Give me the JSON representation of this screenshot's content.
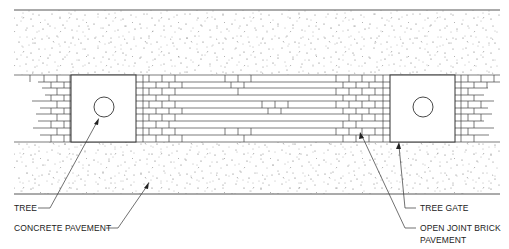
{
  "diagram": {
    "type": "plan-view detail",
    "colors": {
      "line": "#333333",
      "stipple": "#555555",
      "background": "#ffffff"
    }
  },
  "labels": {
    "tree": "TREE",
    "concrete_pavement": "CONCRETE PAVEMENT",
    "tree_gate": "TREE GATE",
    "brick_line1": "OPEN JOINT BRICK",
    "brick_line2": "PAVEMENT"
  }
}
